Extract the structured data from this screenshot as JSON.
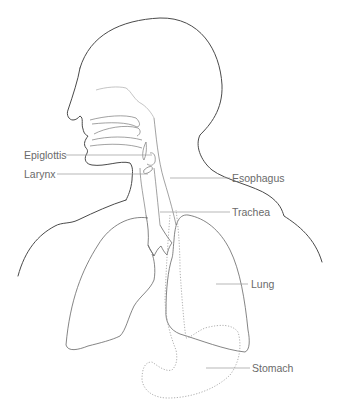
{
  "diagram": {
    "labels": {
      "epiglottis": "Epiglottis",
      "larynx": "Larynx",
      "esophagus": "Esophagus",
      "trachea": "Trachea",
      "lung": "Lung",
      "stomach": "Stomach"
    },
    "colors": {
      "outline": "#444444",
      "organ": "#777777",
      "dotted": "#9a9a9a",
      "leader": "#9a9a9a",
      "text": "#6a6a6a"
    }
  }
}
